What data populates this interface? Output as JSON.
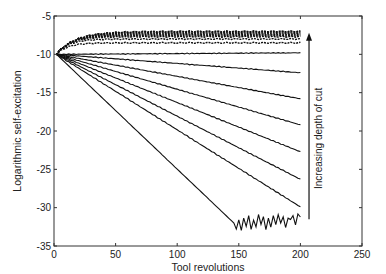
{
  "chart_data": {
    "type": "line",
    "title": "",
    "xlabel": "Tool revolutions",
    "ylabel": "Logarithmic self-excitation",
    "xlim": [
      0,
      250
    ],
    "ylim": [
      -35,
      -5
    ],
    "xticks": [
      0,
      50,
      100,
      150,
      200,
      250
    ],
    "yticks": [
      -5,
      -10,
      -15,
      -20,
      -25,
      -30,
      -35
    ],
    "grid": false,
    "legend": null,
    "annotation": {
      "text": "Increasing depth of cut",
      "arrow": "upward",
      "x": 207,
      "y_from": -31.5,
      "y_to": -7.3
    },
    "series_start": {
      "x": 2,
      "y": -10
    },
    "series": [
      {
        "name": "depth-1",
        "shape": "saturating",
        "end_y": -7.0,
        "knee_x": 35
      },
      {
        "name": "depth-2",
        "shape": "saturating",
        "end_y": -7.1,
        "knee_x": 32
      },
      {
        "name": "depth-3",
        "shape": "saturating",
        "end_y": -7.25,
        "knee_x": 30
      },
      {
        "name": "depth-4",
        "shape": "saturating",
        "end_y": -7.4,
        "knee_x": 28
      },
      {
        "name": "depth-5",
        "shape": "saturating",
        "end_y": -7.55,
        "knee_x": 26
      },
      {
        "name": "depth-6",
        "shape": "saturating",
        "end_y": -7.7,
        "knee_x": 24
      },
      {
        "name": "depth-7",
        "shape": "saturating",
        "end_y": -8.0,
        "knee_x": 22
      },
      {
        "name": "depth-8",
        "shape": "saturating",
        "end_y": -8.5,
        "knee_x": 20
      },
      {
        "name": "depth-9",
        "shape": "linear",
        "end_y": -9.8
      },
      {
        "name": "depth-10",
        "shape": "linear",
        "end_y": -12.4
      },
      {
        "name": "depth-11",
        "shape": "linear",
        "end_y": -15.8
      },
      {
        "name": "depth-12",
        "shape": "linear",
        "end_y": -19.2
      },
      {
        "name": "depth-13",
        "shape": "linear",
        "end_y": -22.7
      },
      {
        "name": "depth-14",
        "shape": "linear",
        "end_y": -26.3
      },
      {
        "name": "depth-15",
        "shape": "linear",
        "end_y": -29.9
      },
      {
        "name": "depth-16",
        "shape": "noisy-floor",
        "end_y": -31.3,
        "floor_start_x": 146,
        "floor_y": -32.0,
        "noise": [
          0.0,
          -0.8,
          0.4,
          -1.0,
          0.6,
          -0.5,
          0.9,
          -0.9,
          0.3,
          -0.6,
          1.0,
          -0.3,
          0.7,
          -1.0,
          0.5,
          -0.7,
          0.8,
          -0.4,
          0.9,
          -0.2,
          0.6,
          -0.8,
          0.4,
          0.2,
          0.7,
          -0.5,
          0.9,
          0.5
        ]
      }
    ],
    "x_end": 200,
    "line_color": "#111111"
  }
}
